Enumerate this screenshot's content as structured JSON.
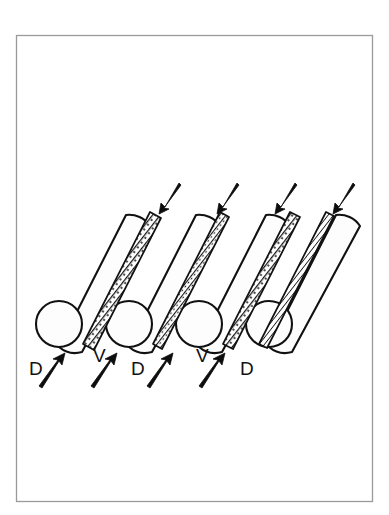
{
  "figure": {
    "background_color": "#ffffff",
    "border_color": "#9a9a9a",
    "stroke_color": "#111111",
    "fill_color": "#fdfdfd",
    "border": {
      "x": 16,
      "y": 35,
      "width": 357,
      "height": 467
    }
  },
  "labels": [
    {
      "id": "label-d-1",
      "text": "D",
      "x": 29,
      "y": 375
    },
    {
      "id": "label-v-1",
      "text": "V",
      "x": 93,
      "y": 362
    },
    {
      "id": "label-d-2",
      "text": "D",
      "x": 131,
      "y": 375
    },
    {
      "id": "label-v-2",
      "text": "V",
      "x": 196,
      "y": 362
    },
    {
      "id": "label-d-3",
      "text": "D",
      "x": 240,
      "y": 375
    }
  ],
  "cylinders": [
    {
      "id": "cylinder-1",
      "top_x": 126,
      "bottom_x": 59,
      "cap_cx": 59,
      "cap_cy": 324,
      "cap_r": 23
    },
    {
      "id": "cylinder-2",
      "top_x": 196,
      "bottom_x": 129,
      "cap_cx": 129,
      "cap_cy": 324,
      "cap_r": 23
    },
    {
      "id": "cylinder-3",
      "top_x": 266,
      "bottom_x": 199,
      "cap_cx": 199,
      "cap_cy": 324,
      "cap_r": 23
    },
    {
      "id": "cylinder-4",
      "top_x": 336,
      "bottom_x": 269,
      "cap_cx": 269,
      "cap_cy": 324,
      "cap_r": 23
    }
  ],
  "strips": [
    {
      "id": "strip-1",
      "top_x": 150,
      "bottom_x": 83
    },
    {
      "id": "strip-2",
      "top_x": 220,
      "bottom_x": 153
    },
    {
      "id": "strip-3",
      "top_x": 290,
      "bottom_x": 223
    },
    {
      "id": "strip-4",
      "top_x": 326,
      "bottom_x": 259
    }
  ],
  "arrows_down": [
    {
      "id": "arrow-down-1",
      "x1": 180,
      "y1": 186,
      "x2": 160,
      "y2": 212
    },
    {
      "id": "arrow-down-2",
      "x1": 238,
      "y1": 186,
      "x2": 218,
      "y2": 212
    },
    {
      "id": "arrow-down-3",
      "x1": 296,
      "y1": 186,
      "x2": 276,
      "y2": 212
    },
    {
      "id": "arrow-down-4",
      "x1": 354,
      "y1": 186,
      "x2": 334,
      "y2": 212
    }
  ],
  "arrows_up": [
    {
      "id": "arrow-up-1",
      "x1": 40,
      "y1": 385,
      "x2": 64,
      "y2": 354
    },
    {
      "id": "arrow-up-2",
      "x1": 92,
      "y1": 385,
      "x2": 116,
      "y2": 354
    },
    {
      "id": "arrow-up-3",
      "x1": 148,
      "y1": 385,
      "x2": 172,
      "y2": 354
    },
    {
      "id": "arrow-up-4",
      "x1": 200,
      "y1": 385,
      "x2": 224,
      "y2": 354
    }
  ],
  "legend": {
    "d_meaning": "D",
    "v_meaning": "V"
  }
}
